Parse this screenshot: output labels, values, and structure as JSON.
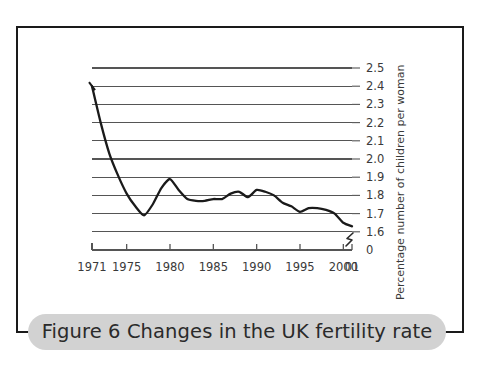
{
  "figure": {
    "caption": "Figure 6 Changes in the UK fertility rate",
    "frame_color": "#1a1a1a",
    "caption_pill_color": "#d2d2d2",
    "line_color": "#1a1a1a",
    "grid_color": "#555555"
  },
  "chart_data": {
    "type": "line",
    "title": "Figure 6 Changes in the UK fertility rate",
    "xlabel": "",
    "ylabel": "Percentage number of children per woman",
    "ylim": [
      1.55,
      2.5
    ],
    "xlim": [
      1971,
      2001
    ],
    "grid": true,
    "legend": "none",
    "axis_break": true,
    "y_ticks": [
      "2.5",
      "2.4",
      "2.3",
      "2.2",
      "2.1",
      "2.0",
      "1.9",
      "1.8",
      "1.7",
      "1.6",
      "0"
    ],
    "x_ticks": [
      "1971",
      "1975",
      "1980",
      "1985",
      "1990",
      "1995",
      "2000",
      "01"
    ],
    "x": [
      1971,
      1972,
      1973,
      1974,
      1975,
      1976,
      1977,
      1978,
      1979,
      1980,
      1981,
      1982,
      1983,
      1984,
      1985,
      1986,
      1987,
      1988,
      1989,
      1990,
      1991,
      1992,
      1993,
      1994,
      1995,
      1996,
      1997,
      1998,
      1999,
      2000,
      2001
    ],
    "values": [
      2.4,
      2.2,
      2.03,
      1.91,
      1.81,
      1.74,
      1.69,
      1.75,
      1.84,
      1.89,
      1.83,
      1.78,
      1.77,
      1.77,
      1.78,
      1.78,
      1.81,
      1.82,
      1.79,
      1.83,
      1.82,
      1.8,
      1.76,
      1.74,
      1.71,
      1.73,
      1.73,
      1.72,
      1.7,
      1.65,
      1.63
    ],
    "series": [
      {
        "name": "UK fertility rate",
        "values": [
          2.4,
          2.2,
          2.03,
          1.91,
          1.81,
          1.74,
          1.69,
          1.75,
          1.84,
          1.89,
          1.83,
          1.78,
          1.77,
          1.77,
          1.78,
          1.78,
          1.81,
          1.82,
          1.79,
          1.83,
          1.82,
          1.8,
          1.76,
          1.74,
          1.71,
          1.73,
          1.73,
          1.72,
          1.7,
          1.65,
          1.63
        ]
      }
    ]
  }
}
